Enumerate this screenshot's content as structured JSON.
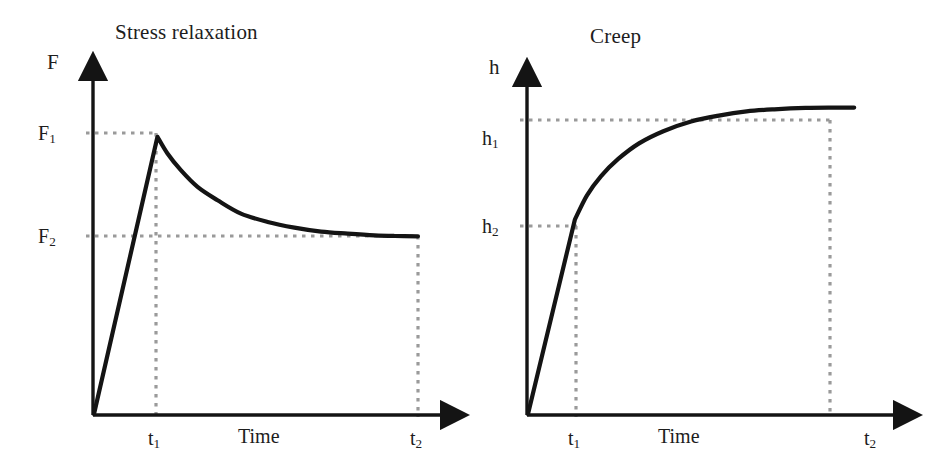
{
  "figure": {
    "background_color": "#ffffff",
    "curve_color": "#141414",
    "axis_color": "#141414",
    "guide_color": "#9a9a9a"
  },
  "panels": [
    {
      "id": "stress-relaxation",
      "title": "Stress relaxation",
      "y_axis_label": "F",
      "x_axis_label": "Time",
      "y_ticks": [
        {
          "id": "F1",
          "text": "F",
          "sub": "1"
        },
        {
          "id": "F2",
          "text": "F",
          "sub": "2"
        }
      ],
      "x_ticks": [
        {
          "id": "t1",
          "text": "t",
          "sub": "1"
        },
        {
          "id": "t2",
          "text": "t",
          "sub": "2"
        }
      ]
    },
    {
      "id": "creep",
      "title": "Creep",
      "y_axis_label": "h",
      "x_axis_label": "Time",
      "y_ticks": [
        {
          "id": "h1",
          "text": "h",
          "sub": "1"
        },
        {
          "id": "h2",
          "text": "h",
          "sub": "2"
        }
      ],
      "x_ticks": [
        {
          "id": "t1",
          "text": "t",
          "sub": "1"
        },
        {
          "id": "t2",
          "text": "t",
          "sub": "2"
        }
      ]
    }
  ],
  "chart_data": [
    {
      "type": "line",
      "title": "Stress relaxation",
      "xlabel": "Time",
      "ylabel": "F",
      "grid": false,
      "legend": "none",
      "xlim": [
        0,
        1
      ],
      "ylim": [
        0,
        1
      ],
      "xtick_labels": [
        "t₁",
        "t₂"
      ],
      "xtick_values": [
        0.19,
        0.97
      ],
      "ytick_labels": [
        "F₁",
        "F₂"
      ],
      "ytick_values": [
        0.83,
        0.53
      ],
      "annotations": [
        "Force rises linearly from origin to peak F₁ at time t₁",
        "Force decays exponentially from F₁ toward asymptote F₂",
        "Force has relaxed to F₂ by time t₂"
      ],
      "series": [
        {
          "name": "Force response",
          "x": [
            0.0,
            0.19,
            0.22,
            0.26,
            0.31,
            0.37,
            0.44,
            0.52,
            0.6,
            0.68,
            0.76,
            0.84,
            0.9,
            0.97
          ],
          "y": [
            0.0,
            0.83,
            0.78,
            0.73,
            0.68,
            0.64,
            0.6,
            0.575,
            0.558,
            0.546,
            0.54,
            0.535,
            0.533,
            0.532
          ]
        }
      ],
      "guides": [
        {
          "kind": "horizontal",
          "at": 0.83,
          "from": 0.0,
          "to": 0.19,
          "label": "F₁"
        },
        {
          "kind": "horizontal",
          "at": 0.53,
          "from": 0.0,
          "to": 0.97,
          "label": "F₂"
        },
        {
          "kind": "vertical",
          "at": 0.19,
          "from": 0.0,
          "to": 0.83,
          "label": "t₁"
        },
        {
          "kind": "vertical",
          "at": 0.97,
          "from": 0.0,
          "to": 0.53,
          "label": "t₂"
        }
      ]
    },
    {
      "type": "line",
      "title": "Creep",
      "xlabel": "Time",
      "ylabel": "h",
      "grid": false,
      "legend": "none",
      "xlim": [
        0,
        1
      ],
      "ylim": [
        0,
        1
      ],
      "xtick_labels": [
        "t₁",
        "t₂"
      ],
      "xtick_values": [
        0.135,
        0.8
      ],
      "ytick_labels": [
        "h₁",
        "h₂"
      ],
      "ytick_values": [
        0.88,
        0.56
      ],
      "annotations": [
        "Displacement rises steeply and linearly from origin to h₂ at time t₁",
        "Displacement then creeps asymptotically toward plateau h₁",
        "Plateau h₁ is essentially reached by time t₂"
      ],
      "series": [
        {
          "name": "Displacement response",
          "x": [
            0.0,
            0.135,
            0.17,
            0.21,
            0.26,
            0.32,
            0.39,
            0.47,
            0.55,
            0.63,
            0.71,
            0.8,
            0.88,
            0.94
          ],
          "y": [
            0.0,
            0.56,
            0.63,
            0.685,
            0.735,
            0.78,
            0.815,
            0.843,
            0.86,
            0.872,
            0.878,
            0.882,
            0.883,
            0.883
          ]
        }
      ],
      "guides": [
        {
          "kind": "horizontal",
          "at": 0.88,
          "from": 0.0,
          "to": 0.8,
          "label": "h₁"
        },
        {
          "kind": "horizontal",
          "at": 0.56,
          "from": 0.0,
          "to": 0.135,
          "label": "h₂"
        },
        {
          "kind": "vertical",
          "at": 0.135,
          "from": 0.0,
          "to": 0.56,
          "label": "t₁"
        },
        {
          "kind": "vertical",
          "at": 0.8,
          "from": 0.0,
          "to": 0.88,
          "label": "t₂"
        }
      ]
    }
  ]
}
